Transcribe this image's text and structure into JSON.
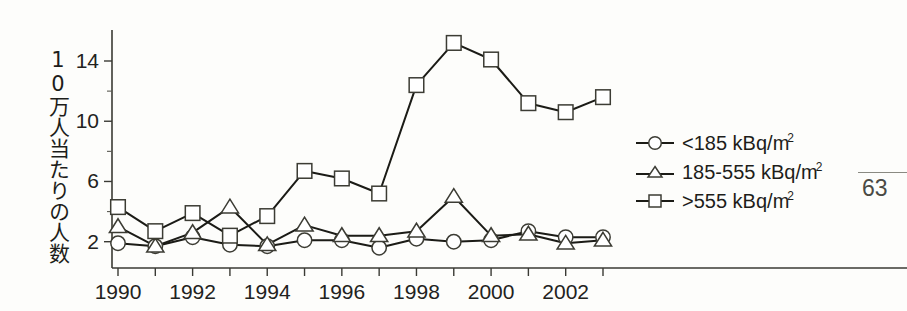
{
  "page": {
    "page_number": "63",
    "corner_mark": ""
  },
  "axis": {
    "y_label_text": "10万人当たりの人数",
    "y_ticks": [
      2,
      6,
      10,
      14
    ],
    "y_tick_labels": [
      "2",
      "6",
      "10",
      "14"
    ],
    "y_minor_ticks": [
      4,
      8,
      12
    ],
    "x_tick_labels": [
      "1990",
      "1992",
      "1994",
      "1996",
      "1998",
      "2000",
      "2002"
    ],
    "x_label_years": [
      1990,
      1992,
      1994,
      1996,
      1998,
      2000,
      2002
    ]
  },
  "legend": {
    "position": "right",
    "entries": [
      {
        "marker": "circle-marker",
        "label": "<185 kBq/m",
        "sup": "2"
      },
      {
        "marker": "triangle-marker",
        "label": "185-555 kBq/m",
        "sup": "2"
      },
      {
        "marker": "square-marker",
        "label": ">555 kBq/m",
        "sup": "2"
      }
    ]
  },
  "colors": {
    "line": "#1b1b16",
    "marker_fill": "#ffffff",
    "marker_stroke": "#3c3c34",
    "axis": "#3a3a34",
    "background": "#fdfdfb"
  },
  "chart_data": {
    "type": "line",
    "title": "",
    "xlabel": "",
    "ylabel": "10万人当たりの人数",
    "x": [
      1990,
      1991,
      1992,
      1993,
      1994,
      1995,
      1996,
      1997,
      1998,
      1999,
      2000,
      2001,
      2002,
      2003
    ],
    "xlim": [
      1989.5,
      2003.6
    ],
    "ylim": [
      0.6,
      16.2
    ],
    "grid": false,
    "series": [
      {
        "name": "<185 kBq/m2",
        "marker": "circle",
        "values": [
          1.9,
          1.7,
          2.3,
          1.8,
          1.7,
          2.1,
          2.1,
          1.6,
          2.2,
          2.0,
          2.1,
          2.7,
          2.3,
          2.3
        ]
      },
      {
        "name": "185-555 kBq/m2",
        "marker": "triangle",
        "values": [
          3.0,
          1.7,
          2.6,
          4.3,
          1.8,
          3.1,
          2.4,
          2.4,
          2.7,
          5.0,
          2.4,
          2.5,
          1.9,
          2.1
        ]
      },
      {
        "name": ">555 kBq/m2",
        "marker": "square",
        "values": [
          4.3,
          2.7,
          3.9,
          2.4,
          3.7,
          6.7,
          6.2,
          5.2,
          12.4,
          15.2,
          14.1,
          11.2,
          10.6,
          11.6
        ]
      }
    ]
  }
}
